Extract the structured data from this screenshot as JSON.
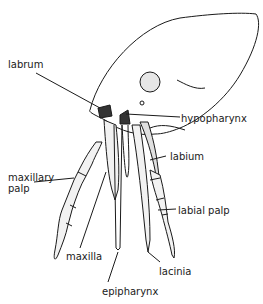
{
  "diagram": {
    "labels": {
      "labrum": "labrum",
      "hypopharynx": "hypopharynx",
      "labium": "labium",
      "maxillary_palp_line1": "maxillary",
      "maxillary_palp_line2": "palp",
      "labial_palp": "labial palp",
      "maxilla": "maxilla",
      "lacinia": "lacinia",
      "epipharynx": "epipharynx"
    }
  }
}
